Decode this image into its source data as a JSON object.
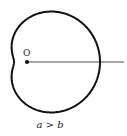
{
  "diagram": {
    "type": "limacon",
    "equation": "r = a + b cos θ",
    "params": {
      "a": 43,
      "b": 30
    },
    "pole": {
      "x": 27,
      "y": 62
    },
    "ray_end_x": 124,
    "stroke_color": "#111111",
    "origin_label": "O",
    "caption": "a > b"
  }
}
